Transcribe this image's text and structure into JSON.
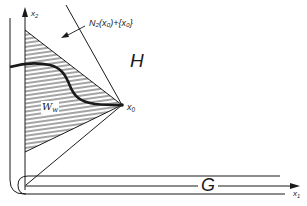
{
  "diagram": {
    "labels": {
      "x2_axis": "x",
      "x2_sub": "2",
      "x1_axis": "x",
      "x1_sub": "1",
      "x0_point": "x",
      "x0_sub": "0",
      "normal_cone": "N₂(x₀)+{x₀}",
      "region_H": "H",
      "region_G": "G",
      "region_W": "W",
      "region_W_sub": "w"
    },
    "colors": {
      "ink": "#1a1a1a",
      "background": "#ffffff"
    }
  }
}
